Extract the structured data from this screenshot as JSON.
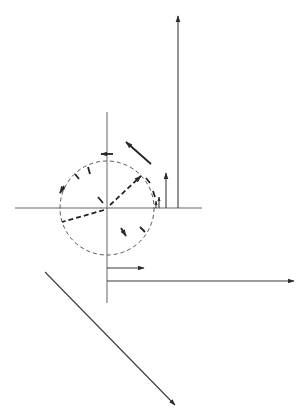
{
  "figure": {
    "type": "vector-phasor-diagram",
    "colors": {
      "background": "#ffffff",
      "ink": "#3a3a3a"
    },
    "origin": {
      "x": 107,
      "y": 208
    },
    "circle": {
      "cx": 107,
      "cy": 208,
      "r": 47,
      "style": "dashed"
    },
    "axes": {
      "horizontal": {
        "x1": 15,
        "x2": 202,
        "y": 208
      },
      "vertical": {
        "x": 107,
        "y1": 112,
        "y2": 303
      }
    },
    "vertical_arrows": [
      {
        "x": 178,
        "y_base": 208,
        "y_tip": 16,
        "label": "long"
      },
      {
        "x": 166,
        "y_base": 208,
        "y_tip": 173,
        "label": "medium"
      },
      {
        "x": 159,
        "y_base": 208,
        "y_tip": 197,
        "label": "small"
      },
      {
        "x": 156,
        "y_base": 208,
        "y_tip": 201,
        "label": "tiny"
      }
    ],
    "horizontal_arrows": [
      {
        "y": 268,
        "x_base": 107,
        "x_tip": 144,
        "label": "short"
      },
      {
        "y": 281,
        "x_base": 107,
        "x_tip": 294,
        "label": "long"
      }
    ],
    "diagonal_arrow": {
      "x1": 45,
      "y1": 272,
      "x2": 175,
      "y2": 405
    },
    "free_arrow": {
      "x1": 126,
      "y1": 142,
      "x2": 151,
      "y2": 164
    }
  }
}
